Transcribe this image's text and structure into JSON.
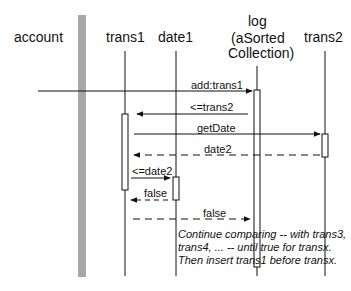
{
  "objects": [
    {
      "id": "account",
      "label": "account"
    },
    {
      "id": "trans1",
      "label": "trans1"
    },
    {
      "id": "date1",
      "label": "date1"
    },
    {
      "id": "log",
      "label_lines": [
        "log",
        "(aSorted",
        "Collection)"
      ]
    },
    {
      "id": "trans2",
      "label": "trans2"
    }
  ],
  "messages": [
    {
      "label": "add:trans1",
      "from": "account",
      "to": "log",
      "style": "solid"
    },
    {
      "label": "<=trans2",
      "from": "log",
      "to": "trans1",
      "style": "solid"
    },
    {
      "label": "getDate",
      "from": "trans1",
      "to": "trans2",
      "style": "solid"
    },
    {
      "label": "date2",
      "from": "trans2",
      "to": "trans1",
      "style": "dashed"
    },
    {
      "label": "<=date2",
      "from": "trans1",
      "to": "date1",
      "style": "solid"
    },
    {
      "label": "false",
      "from": "date1",
      "to": "trans1",
      "style": "dashed"
    },
    {
      "label": "false",
      "from": "trans1",
      "to": "log",
      "style": "dashed"
    }
  ],
  "note": {
    "lines": [
      "Continue comparing -- with trans3,",
      "trans4, ... -- until true for transx.",
      "Then insert trans1 before transx."
    ]
  },
  "colors": {
    "line": "#111111",
    "account_bar": "#a8a8a8"
  }
}
